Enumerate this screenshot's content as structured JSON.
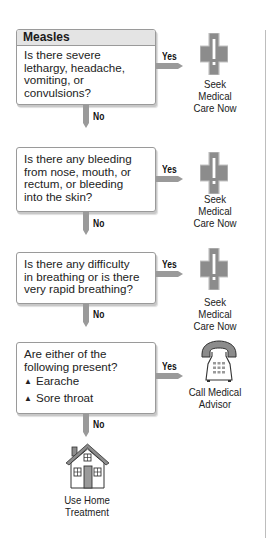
{
  "flowchart": {
    "title": "Measles",
    "questions": [
      {
        "text_lines": [
          "Is there severe",
          "lethargy, headache,",
          "vomiting, or",
          "convulsions?"
        ],
        "yes_label": "Yes",
        "no_label": "No",
        "yes_outcome": {
          "icon": "medical-cross-icon",
          "lines": [
            "Seek Medical",
            "Care Now"
          ]
        }
      },
      {
        "text_lines": [
          "Is there any bleeding",
          "from nose, mouth, or",
          "rectum, or bleeding",
          "into the skin?"
        ],
        "yes_label": "Yes",
        "no_label": "No",
        "yes_outcome": {
          "icon": "medical-cross-icon",
          "lines": [
            "Seek Medical",
            "Care Now"
          ]
        }
      },
      {
        "text_lines": [
          "Is there any difficulty",
          "in breathing or is there",
          "very rapid breathing?"
        ],
        "yes_label": "Yes",
        "no_label": "No",
        "yes_outcome": {
          "icon": "medical-cross-icon",
          "lines": [
            "Seek Medical",
            "Care Now"
          ]
        }
      },
      {
        "text_lines": [
          "Are either of the",
          "following present?"
        ],
        "bullets": [
          "Earache",
          "Sore throat"
        ],
        "bullet_icon": "triangle-bullet-icon",
        "yes_label": "Yes",
        "no_label": "No",
        "yes_outcome": {
          "icon": "telephone-icon",
          "lines": [
            "Call Medical",
            "Advisor"
          ]
        }
      }
    ],
    "final_outcome": {
      "icon": "house-icon",
      "lines": [
        "Use Home",
        "Treatment"
      ]
    }
  },
  "colors": {
    "arrow": "#9a9a9a",
    "icon_fill": "#8c8c8c",
    "header_bg": "#e4e4e4",
    "border": "#9a9a9a"
  }
}
